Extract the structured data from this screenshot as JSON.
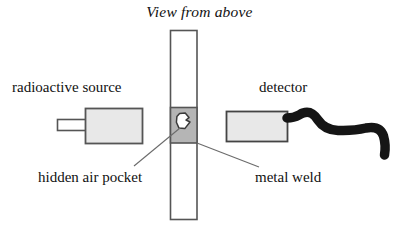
{
  "figure": {
    "title": "View from above",
    "kind": "cross-section schematic diagram",
    "background_color": "#ffffff"
  },
  "labels": {
    "source": "radioactive source",
    "detector": "detector",
    "air_pocket": "hidden air pocket",
    "metal_weld": "metal weld"
  },
  "colors": {
    "outline": "#4a4a4a",
    "box_fill": "#e8e8e8",
    "weld_fill": "#b5b5b5",
    "pocket_fill": "#ffffff",
    "cable": "#151515",
    "leader_line": "#6b6b6b",
    "text": "#111111"
  },
  "parts": {
    "source_nozzle": {
      "name": "collimator nozzle",
      "fill": "#ffffff"
    },
    "source_body": {
      "name": "radioactive source housing",
      "fill": "#e8e8e8"
    },
    "workpiece_bar": {
      "name": "vertical metal plate",
      "fill": "#ffffff"
    },
    "weld_block": {
      "name": "metal weld region",
      "fill": "#b5b5b5"
    },
    "air_pocket": {
      "name": "hidden air pocket void",
      "fill": "#ffffff"
    },
    "detector_body": {
      "name": "detector housing",
      "fill": "#e8e8e8"
    },
    "detector_cable": {
      "name": "detector cable",
      "fill": "#151515"
    }
  },
  "leader_lines": [
    {
      "from": "hidden air pocket label",
      "to": "air pocket in weld"
    },
    {
      "from": "metal weld label",
      "to": "weld block right edge"
    }
  ]
}
